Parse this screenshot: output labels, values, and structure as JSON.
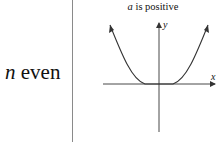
{
  "row": {
    "label_var": "n",
    "label_text": " even"
  },
  "graph": {
    "title_var": "a",
    "title_text": " is positive",
    "y_axis_label": "y",
    "x_axis_label": "x",
    "curve": "y = a·x^n, n even, a > 0 (U-shaped, flat near origin, both ends rising)"
  }
}
